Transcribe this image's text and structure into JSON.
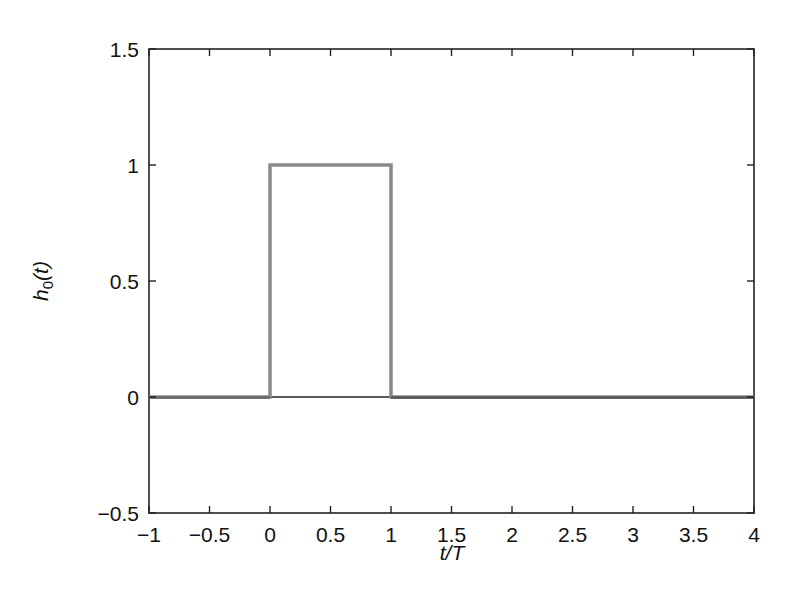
{
  "chart_data": {
    "type": "line",
    "title": "",
    "xlabel": "t/T",
    "ylabel": "h0(t)",
    "xlim": [
      -1,
      4
    ],
    "ylim": [
      -0.5,
      1.5
    ],
    "grid": false,
    "legend": null,
    "x_ticks": [
      -1,
      -0.5,
      0,
      0.5,
      1,
      1.5,
      2,
      2.5,
      3,
      3.5,
      4
    ],
    "x_tick_labels": [
      "−1",
      "−0.5",
      "0",
      "0.5",
      "1",
      "1.5",
      "2",
      "2.5",
      "3",
      "3.5",
      "4"
    ],
    "y_ticks": [
      -0.5,
      0,
      0.5,
      1,
      1.5
    ],
    "y_tick_labels": [
      "−0.5",
      "0",
      "0.5",
      "1",
      "1.5"
    ],
    "series": [
      {
        "name": "h0(t) rectangular pulse",
        "color": "#8a8a8a",
        "x": [
          -1,
          0,
          0,
          1,
          1,
          4
        ],
        "y": [
          0,
          0,
          1,
          1,
          0,
          0
        ]
      }
    ],
    "zero_line": {
      "y": 0,
      "color": "#222222"
    }
  },
  "labels": {
    "xlabel_main": "t/T",
    "ylabel_h": "h",
    "ylabel_sub": "0",
    "ylabel_rest": "(t)"
  }
}
